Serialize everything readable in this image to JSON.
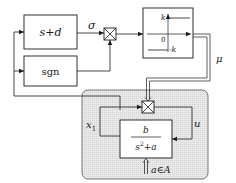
{
  "diagram": {
    "type": "block-diagram",
    "blocks": {
      "sliding_surface": {
        "label": "s+d"
      },
      "sign": {
        "label": "sgn"
      },
      "relay": {
        "upper_level": "k",
        "zero": "0",
        "lower_level": "-k"
      },
      "plant": {
        "numerator": "b",
        "denominator_base": "s",
        "denominator_exp": "2",
        "denominator_rest": "+a",
        "parameter_input": "a∈A"
      }
    },
    "signals": {
      "sigma": "σ",
      "mu": "μ",
      "x1": "x",
      "x1_sub": "1",
      "u": "u"
    },
    "colors": {
      "line": "#1a1a1a",
      "plant_fill": "#e6e6e6",
      "plant_border": "#555555",
      "block_fill": "#ffffff"
    }
  }
}
